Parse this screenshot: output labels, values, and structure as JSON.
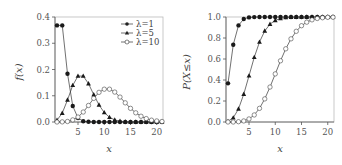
{
  "chart_data": [
    {
      "type": "line",
      "title": "",
      "xlabel": "x",
      "ylabel": "f(x)",
      "xlim": [
        1,
        21
      ],
      "ylim": [
        0,
        0.4
      ],
      "xticks": [
        5,
        10,
        15,
        20
      ],
      "yticks": [
        "0.0",
        "0.1",
        "0.2",
        "0.3",
        "0.4"
      ],
      "grid": false,
      "legend_position": "upper right",
      "x": [
        1,
        2,
        3,
        4,
        5,
        6,
        7,
        8,
        9,
        10,
        11,
        12,
        13,
        14,
        15,
        16,
        17,
        18,
        19,
        20,
        21
      ],
      "series": [
        {
          "name": "λ=1",
          "marker": "filled-circle",
          "values": [
            0.368,
            0.368,
            0.184,
            0.061,
            0.015,
            0.003,
            0.001,
            0,
            0,
            0,
            0,
            0,
            0,
            0,
            0,
            0,
            0,
            0,
            0,
            0,
            0
          ]
        },
        {
          "name": "λ=5",
          "marker": "filled-triangle",
          "values": [
            0.007,
            0.034,
            0.084,
            0.14,
            0.175,
            0.175,
            0.146,
            0.104,
            0.065,
            0.036,
            0.018,
            0.008,
            0.003,
            0.001,
            0,
            0,
            0,
            0,
            0,
            0,
            0
          ]
        },
        {
          "name": "λ=10",
          "marker": "open-circle",
          "values": [
            0.0,
            0.0005,
            0.002,
            0.008,
            0.019,
            0.038,
            0.063,
            0.09,
            0.113,
            0.125,
            0.125,
            0.114,
            0.095,
            0.073,
            0.052,
            0.035,
            0.022,
            0.013,
            0.007,
            0.004,
            0.002
          ]
        }
      ]
    },
    {
      "type": "line",
      "title": "",
      "xlabel": "x",
      "ylabel": "P(X≤x)",
      "xlim": [
        1,
        21
      ],
      "ylim": [
        0,
        1.0
      ],
      "xticks": [
        5,
        10,
        15,
        20
      ],
      "yticks": [
        "0.0",
        "0.2",
        "0.4",
        "0.6",
        "0.8",
        "1.0"
      ],
      "grid": false,
      "x": [
        1,
        2,
        3,
        4,
        5,
        6,
        7,
        8,
        9,
        10,
        11,
        12,
        13,
        14,
        15,
        16,
        17,
        18,
        19,
        20,
        21
      ],
      "series": [
        {
          "name": "λ=1",
          "marker": "filled-circle",
          "values": [
            0.368,
            0.736,
            0.92,
            0.981,
            0.996,
            0.999,
            1,
            1,
            1,
            1,
            1,
            1,
            1,
            1,
            1,
            1,
            1,
            1,
            1,
            1,
            1
          ]
        },
        {
          "name": "λ=5",
          "marker": "filled-triangle",
          "values": [
            0.007,
            0.04,
            0.125,
            0.265,
            0.44,
            0.616,
            0.762,
            0.867,
            0.932,
            0.968,
            0.986,
            0.995,
            0.998,
            0.999,
            1,
            1,
            1,
            1,
            1,
            1,
            1
          ]
        },
        {
          "name": "λ=10",
          "marker": "open-circle",
          "values": [
            0.0,
            0.0,
            0.003,
            0.01,
            0.029,
            0.067,
            0.13,
            0.22,
            0.333,
            0.458,
            0.583,
            0.697,
            0.792,
            0.864,
            0.917,
            0.951,
            0.973,
            0.986,
            0.993,
            0.997,
            0.998
          ]
        }
      ]
    }
  ],
  "left": {
    "ylabel": "f(x)",
    "xlabel": "x",
    "yticks": [
      "0.0",
      "0.1",
      "0.2",
      "0.3",
      "0.4"
    ],
    "xticks": [
      "5",
      "10",
      "15",
      "20"
    ],
    "legend": [
      "λ=1",
      "λ=5",
      "λ=10"
    ]
  },
  "right": {
    "ylabel": "P(X≤x)",
    "xlabel": "x",
    "yticks": [
      "0.0",
      "0.2",
      "0.4",
      "0.6",
      "0.8",
      "1.0"
    ],
    "xticks": [
      "5",
      "10",
      "15",
      "20"
    ]
  },
  "colors": {
    "line": "#333333",
    "axis": "#555555",
    "box": "#bbbbbb"
  }
}
